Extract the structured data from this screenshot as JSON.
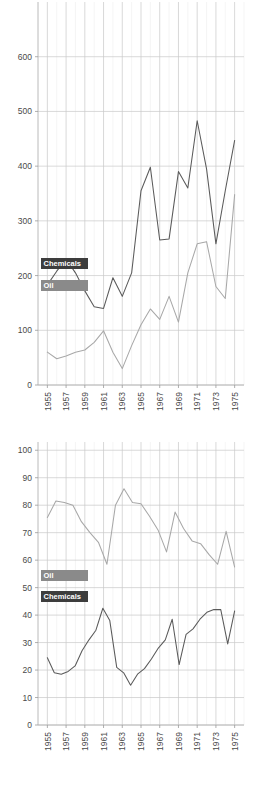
{
  "page": {
    "background": "#ffffff",
    "width": 260,
    "height": 798
  },
  "colors": {
    "chemicals_line": "#5a5a5a",
    "oil_line": "#a8a8a8",
    "legend_dark": "#3d3d3d",
    "legend_gray": "#8a8a8a",
    "gridline_major": "#c9c9c9",
    "gridline_minor": "#eeeeee",
    "axis": "#b0b0b0",
    "tick_text": "#4a4a4a"
  },
  "legend_labels": {
    "chemicals": "Chemicals",
    "oil": "Oil"
  },
  "chart_data": [
    {
      "id": "top",
      "type": "line",
      "title": "",
      "subtitle": "",
      "xlabel": "",
      "ylabel": "",
      "grid": true,
      "legend_position": "inside-left",
      "xlim": [
        1954,
        1976
      ],
      "ylim": [
        0,
        700
      ],
      "yticks": [
        0,
        100,
        200,
        300,
        400,
        500,
        600
      ],
      "ytick_labels": [
        "0",
        "100",
        "200",
        "300",
        "400",
        "500",
        "600"
      ],
      "xticks": [
        1955,
        1957,
        1959,
        1961,
        1963,
        1965,
        1967,
        1969,
        1971,
        1973,
        1975
      ],
      "xtick_labels": [
        "1955",
        "1957",
        "1959",
        "1961",
        "1963",
        "1965",
        "1967",
        "1969",
        "1971",
        "1973",
        "1975"
      ],
      "x": [
        1955,
        1956,
        1957,
        1958,
        1959,
        1960,
        1961,
        1962,
        1963,
        1964,
        1965,
        1966,
        1967,
        1968,
        1969,
        1970,
        1971,
        1972,
        1973,
        1974,
        1975
      ],
      "series": [
        {
          "name": "Chemicals",
          "color": "#5a5a5a",
          "values": [
            183,
            208,
            230,
            205,
            172,
            143,
            140,
            196,
            162,
            205,
            355,
            398,
            265,
            267,
            390,
            360,
            483,
            395,
            258,
            355,
            447
          ]
        },
        {
          "name": "Oil",
          "color": "#a8a8a8",
          "values": [
            60,
            48,
            53,
            60,
            64,
            78,
            99,
            60,
            30,
            72,
            110,
            139,
            120,
            162,
            115,
            205,
            258,
            262,
            180,
            158,
            348
          ]
        }
      ]
    },
    {
      "id": "bottom",
      "type": "line",
      "title": "",
      "subtitle": "",
      "xlabel": "",
      "ylabel": "",
      "grid": true,
      "legend_position": "inside-left",
      "xlim": [
        1954,
        1976
      ],
      "ylim": [
        0,
        103
      ],
      "yticks": [
        0,
        10,
        20,
        30,
        40,
        50,
        60,
        70,
        80,
        90,
        100
      ],
      "ytick_labels": [
        "0",
        "10",
        "20",
        "30",
        "40",
        "50",
        "60",
        "70",
        "80",
        "90",
        "100"
      ],
      "xticks": [
        1955,
        1957,
        1959,
        1961,
        1963,
        1965,
        1967,
        1969,
        1971,
        1973,
        1975
      ],
      "xtick_labels": [
        "1955",
        "1957",
        "1959",
        "1961",
        "1963",
        "1965",
        "1967",
        "1969",
        "1971",
        "1973",
        "1975"
      ],
      "x": [
        1955,
        1956,
        1957,
        1958,
        1959,
        1960,
        1961,
        1962,
        1963,
        1964,
        1965,
        1966,
        1967,
        1968,
        1969,
        1970,
        1971,
        1972,
        1973,
        1974,
        1975
      ],
      "series": [
        {
          "name": "Oil",
          "color": "#a8a8a8",
          "values": [
            75.5,
            81.5,
            81,
            80,
            74,
            70,
            66.5,
            58.5,
            80,
            86,
            81,
            80.5,
            76,
            71,
            63,
            77.5,
            71.5,
            67,
            66,
            62,
            58.5,
            70.5,
            57.5
          ]
        },
        {
          "name": "Chemicals",
          "color": "#5a5a5a",
          "values": [
            24.5,
            19,
            18.5,
            19.5,
            21.5,
            27,
            31,
            34.5,
            42.5,
            38,
            21,
            19,
            14.5,
            18.5,
            20.5,
            24,
            28,
            31,
            38.5,
            22,
            33,
            35,
            38.5,
            41,
            42,
            42,
            29.5,
            41.5
          ]
        }
      ]
    }
  ]
}
